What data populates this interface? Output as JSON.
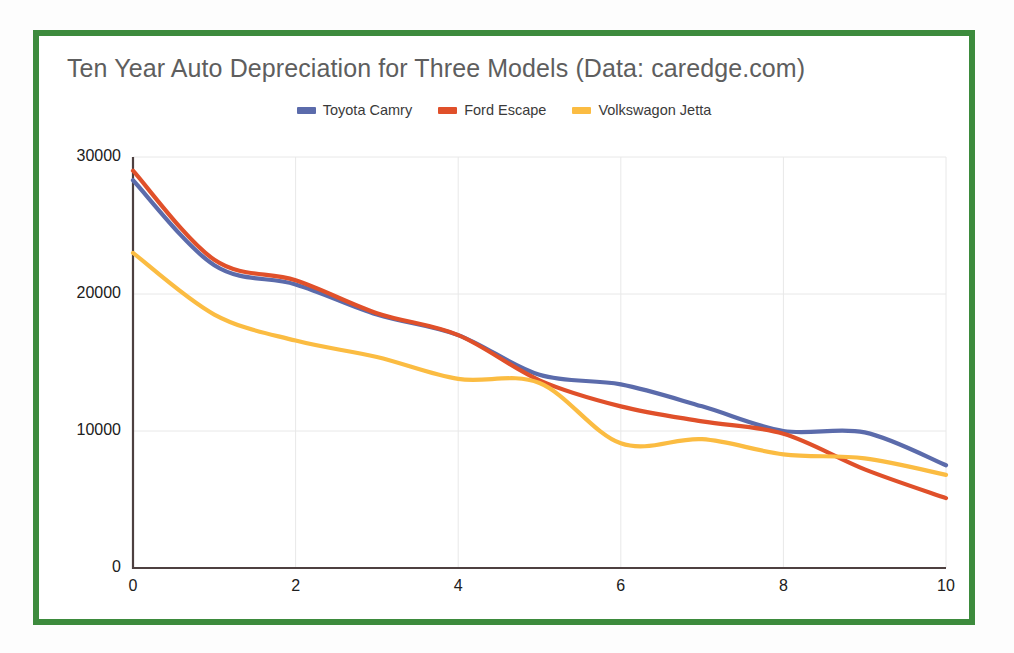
{
  "chart_data": {
    "type": "line",
    "title": "Ten Year Auto Depreciation for Three Models (Data: caredge.com)",
    "xlabel": "",
    "ylabel": "",
    "x": [
      0,
      1,
      2,
      3,
      4,
      5,
      6,
      7,
      8,
      9,
      10
    ],
    "xlim": [
      0,
      10
    ],
    "ylim": [
      0,
      30000
    ],
    "xticks": [
      "0",
      "2",
      "4",
      "6",
      "8",
      "10"
    ],
    "xtick_values": [
      0,
      2,
      4,
      6,
      8,
      10
    ],
    "yticks": [
      "0",
      "10000",
      "20000",
      "30000"
    ],
    "ytick_values": [
      0,
      10000,
      20000,
      30000
    ],
    "grid": true,
    "legend_position": "top-center",
    "series": [
      {
        "name": "Toyota Camry",
        "color": "#5b6bab",
        "values": [
          28300,
          22100,
          20700,
          18500,
          17000,
          14100,
          13400,
          11800,
          10000,
          9900,
          7500
        ]
      },
      {
        "name": "Ford Escape",
        "color": "#e0502a",
        "values": [
          29000,
          22500,
          21000,
          18600,
          17000,
          13700,
          11800,
          10700,
          9800,
          7200,
          5100
        ]
      },
      {
        "name": "Volkswagon Jetta",
        "color": "#fbbc42",
        "values": [
          23000,
          18500,
          16600,
          15400,
          13800,
          13500,
          9100,
          9400,
          8300,
          8000,
          6800
        ]
      }
    ]
  },
  "frame": {
    "border_color": "#3d8b3d",
    "background": "#ffffff"
  },
  "title_color": "#5e5e5e",
  "axis_color": "#4d4040",
  "grid_color": "#e8e8e8"
}
